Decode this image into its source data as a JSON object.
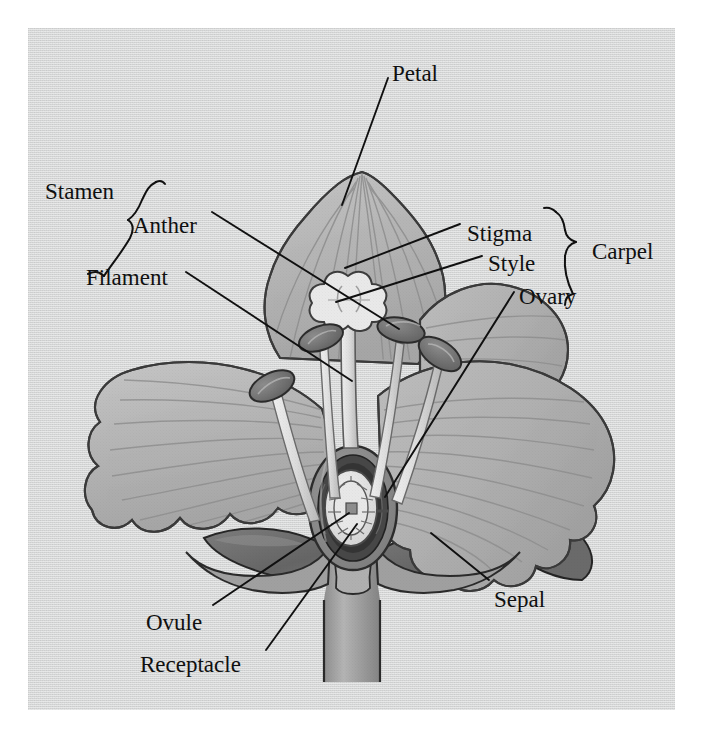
{
  "figure": {
    "kind": "botanical-cross-section",
    "background_color": "#d6d7d7",
    "page_color": "#ffffff",
    "ink_color": "#101010",
    "panel": {
      "x": 28,
      "y": 28,
      "width": 647,
      "height": 682
    }
  },
  "labels": [
    {
      "id": "petal",
      "text": "Petal",
      "x": 392,
      "y": 62,
      "anchor": "start"
    },
    {
      "id": "stamen",
      "text": "Stamen",
      "x": 45,
      "y": 180,
      "anchor": "start"
    },
    {
      "id": "anther",
      "text": "Anther",
      "x": 133,
      "y": 214,
      "anchor": "start"
    },
    {
      "id": "stigma",
      "text": "Stigma",
      "x": 467,
      "y": 222,
      "anchor": "start"
    },
    {
      "id": "style",
      "text": "Style",
      "x": 488,
      "y": 252,
      "anchor": "start"
    },
    {
      "id": "carpel",
      "text": "Carpel",
      "x": 592,
      "y": 240,
      "anchor": "start"
    },
    {
      "id": "filament",
      "text": "Filament",
      "x": 86,
      "y": 266,
      "anchor": "start"
    },
    {
      "id": "ovary",
      "text": "Ovary",
      "x": 519,
      "y": 285,
      "anchor": "start"
    },
    {
      "id": "sepal",
      "text": "Sepal",
      "x": 494,
      "y": 588,
      "anchor": "start"
    },
    {
      "id": "ovule",
      "text": "Ovule",
      "x": 146,
      "y": 611,
      "anchor": "start"
    },
    {
      "id": "receptacle",
      "text": "Receptacle",
      "x": 140,
      "y": 653,
      "anchor": "start"
    }
  ],
  "leader_lines": [
    {
      "id": "petal-leader",
      "from": [
        388,
        78
      ],
      "to": [
        342,
        205
      ]
    },
    {
      "id": "anther-leader",
      "from": [
        212,
        212
      ],
      "to": [
        399,
        329
      ]
    },
    {
      "id": "filament-leader",
      "from": [
        186,
        272
      ],
      "to": [
        352,
        381
      ]
    },
    {
      "id": "stigma-leader",
      "from": [
        460,
        222
      ],
      "to": [
        345,
        268
      ]
    },
    {
      "id": "style-leader",
      "from": [
        482,
        255
      ],
      "to": [
        336,
        302
      ]
    },
    {
      "id": "ovary-leader",
      "from": [
        514,
        292
      ],
      "to": [
        385,
        497
      ]
    },
    {
      "id": "sepal-leader",
      "from": [
        489,
        580
      ],
      "to": [
        431,
        533
      ]
    },
    {
      "id": "ovule-leader",
      "from": [
        213,
        605
      ],
      "to": [
        349,
        513
      ]
    },
    {
      "id": "receptacle-leader",
      "from": [
        265,
        650
      ],
      "to": [
        356,
        523
      ]
    }
  ],
  "brackets": [
    {
      "id": "stamen-bracket",
      "orientation": "diagonal",
      "groups": [
        "anther",
        "filament"
      ]
    },
    {
      "id": "carpel-bracket",
      "orientation": "vertical",
      "groups": [
        "stigma",
        "style",
        "ovary"
      ]
    }
  ],
  "parts": {
    "petals": {
      "count": 4,
      "fill": "#b9b9b9",
      "stroke": "#3b3b3b",
      "note": "ruffled margins, radiating veins"
    },
    "sepals": {
      "count": 3,
      "fill": "#6f6f6f",
      "stroke": "#2b2b2b",
      "note": "dark pointed bracts below petals"
    },
    "stamens": {
      "count": 4,
      "anther_fill": "#6e6e6e",
      "filament_fill": "#dcdcdc"
    },
    "carpel": {
      "stigma_fill": "#e6e6e6",
      "style_fill": "#d8d8d8",
      "ovary_wall": "#8d8d8d",
      "ovary_cavity": "#3a3a3a"
    },
    "ovule": {
      "fill": "#e4e4e4",
      "stroke": "#4a4a4a",
      "note": "ring of cells with central embryo sac"
    },
    "receptacle": {
      "fill": "#9b9b9b",
      "note": "swollen stem base supporting floral parts"
    },
    "pedicel": {
      "fill": "#a5a5a5",
      "note": "stalk, cut off at bottom of frame"
    }
  }
}
